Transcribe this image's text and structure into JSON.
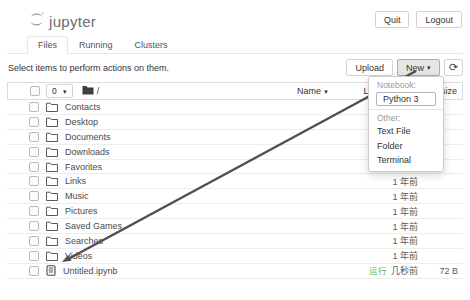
{
  "header": {
    "logo_text": "jupyter",
    "quit_label": "Quit",
    "logout_label": "Logout"
  },
  "tabs": [
    {
      "label": "Files"
    },
    {
      "label": "Running"
    },
    {
      "label": "Clusters"
    }
  ],
  "actions": {
    "hint": "Select items to perform actions on them.",
    "upload_label": "Upload",
    "new_label": "New",
    "caret": "▾",
    "refresh_glyph": "⟳"
  },
  "list_header": {
    "selected_count": "0",
    "caret": "▾",
    "breadcrumb": "/",
    "name_label": "Name",
    "sort_glyph": "▼",
    "last_modified_label": "Last Modified",
    "file_size_label": "File size"
  },
  "new_menu": {
    "notebook_header": "Notebook:",
    "kernel_label": "Python 3",
    "other_header": "Other:",
    "items": [
      "Text File",
      "Folder",
      "Terminal"
    ]
  },
  "rows": [
    {
      "name": "Contacts",
      "type": "folder",
      "modified": "1 年前",
      "size": ""
    },
    {
      "name": "Desktop",
      "type": "folder",
      "modified": "1 年前",
      "size": ""
    },
    {
      "name": "Documents",
      "type": "folder",
      "modified": "1 年前",
      "size": ""
    },
    {
      "name": "Downloads",
      "type": "folder",
      "modified": "1 年前",
      "size": ""
    },
    {
      "name": "Favorites",
      "type": "folder",
      "modified": "1 年前",
      "size": ""
    },
    {
      "name": "Links",
      "type": "folder",
      "modified": "1 年前",
      "size": ""
    },
    {
      "name": "Music",
      "type": "folder",
      "modified": "1 年前",
      "size": ""
    },
    {
      "name": "Pictures",
      "type": "folder",
      "modified": "1 年前",
      "size": ""
    },
    {
      "name": "Saved Games",
      "type": "folder",
      "modified": "1 年前",
      "size": ""
    },
    {
      "name": "Searches",
      "type": "folder",
      "modified": "1 年前",
      "size": ""
    },
    {
      "name": "Videos",
      "type": "folder",
      "modified": "1 年前",
      "size": ""
    },
    {
      "name": "Untitled.ipynb",
      "type": "notebook",
      "running_label": "运行",
      "modified": "几秒前",
      "size": "72 B"
    }
  ],
  "colors": {
    "running_status": "#5cb85c",
    "annotation_arrow": "#4f4f4f"
  }
}
